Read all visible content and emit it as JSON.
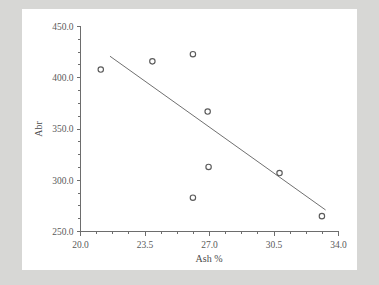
{
  "chart_data": {
    "type": "scatter",
    "title": "",
    "xlabel": "Ash %",
    "ylabel": "Abr",
    "xlim": [
      20.0,
      34.0
    ],
    "ylim": [
      250.0,
      450.0
    ],
    "grid": false,
    "legend": null,
    "x_ticks": [
      "20.0",
      "23.5",
      "27.0",
      "30.5",
      "34.0"
    ],
    "x_tick_values": [
      20.0,
      23.5,
      27.0,
      30.5,
      34.0
    ],
    "y_ticks": [
      "250.0",
      "300.0",
      "350.0",
      "400.0",
      "450.0"
    ],
    "y_tick_values": [
      250.0,
      300.0,
      350.0,
      400.0,
      450.0
    ],
    "x_minor_interval": 0.875,
    "y_minor_interval": 12.5,
    "marker": "open-circle",
    "marker_color": "#5b5b5b",
    "points": [
      {
        "x": 21.1,
        "y": 408
      },
      {
        "x": 23.9,
        "y": 416
      },
      {
        "x": 26.1,
        "y": 423
      },
      {
        "x": 26.1,
        "y": 283
      },
      {
        "x": 26.9,
        "y": 367
      },
      {
        "x": 26.95,
        "y": 313
      },
      {
        "x": 30.8,
        "y": 307
      },
      {
        "x": 33.1,
        "y": 265
      }
    ],
    "series": [
      {
        "name": "Abr vs Ash %",
        "x": [
          21.1,
          23.9,
          26.1,
          26.1,
          26.9,
          26.95,
          30.8,
          33.1
        ],
        "values": [
          408,
          416,
          423,
          283,
          367,
          313,
          307,
          265
        ]
      }
    ],
    "trendline": {
      "type": "line",
      "color": "#707070",
      "x_start": 21.6,
      "y_start": 421,
      "x_end": 33.3,
      "y_end": 271
    }
  },
  "figure": {
    "background_color": "#d7d7d5",
    "canvas_color": "#ffffff",
    "axis_color": "#6d6d6d",
    "text_color": "#5a5a5a"
  }
}
